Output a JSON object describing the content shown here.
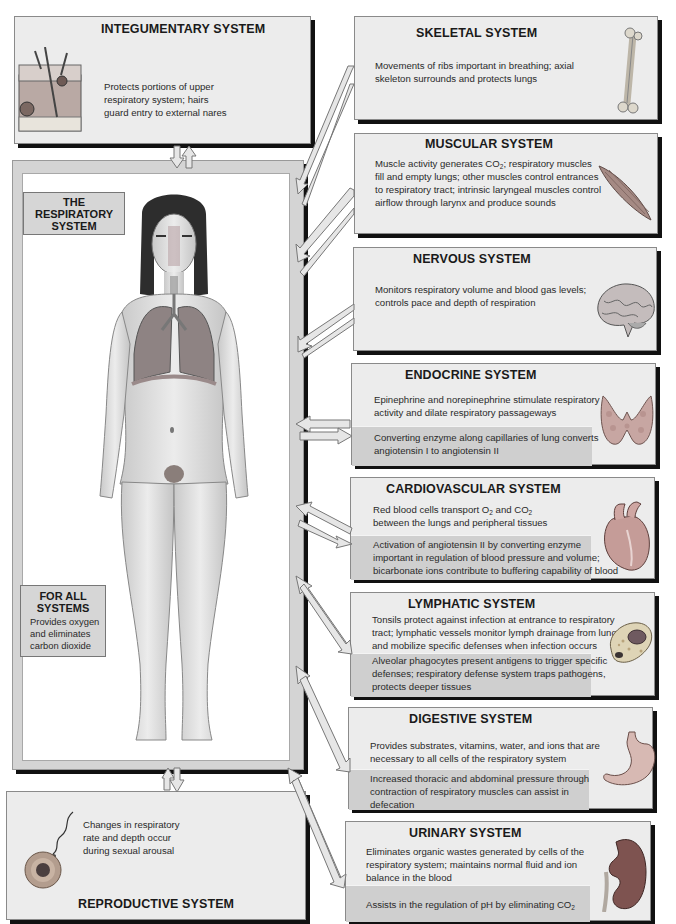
{
  "center": {
    "title_lines": [
      "THE",
      "RESPIRATORY",
      "SYSTEM"
    ],
    "for_all": {
      "title_lines": [
        "FOR ALL",
        "SYSTEMS"
      ],
      "text_lines": [
        "Provides oxygen",
        "and eliminates",
        "carbon dioxide"
      ]
    },
    "figure": "human-figure-with-respiratory-organs"
  },
  "systems": {
    "integumentary": {
      "title": "INTEGUMENTARY SYSTEM",
      "lines": [
        "Protects portions of upper",
        "respiratory system; hairs",
        "guard entry to external nares"
      ],
      "icon": "skin-section-icon"
    },
    "skeletal": {
      "title": "SKELETAL SYSTEM",
      "lines": [
        "Movements of ribs important in breathing; axial",
        "skeleton surrounds and protects lungs"
      ],
      "icon": "bone-icon"
    },
    "muscular": {
      "title": "MUSCULAR SYSTEM",
      "lines_html": [
        "Muscle activity generates CO<sub>2</sub>; respiratory muscles",
        "fill and empty lungs; other muscles control entrances",
        "to respiratory tract; intrinsic laryngeal muscles control",
        "airflow through larynx and produce sounds"
      ],
      "line1_pre": "Muscle activity generates CO",
      "line1_sub": "2",
      "line1_post": "; respiratory muscles",
      "line2": "fill and empty lungs; other muscles control entrances",
      "line3": "to respiratory tract; intrinsic laryngeal muscles control",
      "line4": "airflow through larynx and produce sounds",
      "icon": "muscle-icon"
    },
    "nervous": {
      "title": "NERVOUS SYSTEM",
      "lines": [
        "Monitors respiratory volume and blood gas levels;",
        "controls pace and depth of respiration"
      ],
      "icon": "brain-icon"
    },
    "endocrine": {
      "title": "ENDOCRINE SYSTEM",
      "lines": [
        "Epinephrine and norepinephrine stimulate respiratory",
        "activity and dilate respiratory passageways"
      ],
      "shaded_lines": [
        "Converting enzyme along capillaries of lung converts",
        "angiotensin I to angiotensin II"
      ],
      "icon": "thyroid-icon"
    },
    "cardiovascular": {
      "title": "CARDIOVASCULAR SYSTEM",
      "line1_a": "Red blood cells transport O",
      "line1_sub1": "2",
      "line1_b": " and CO",
      "line1_sub2": "2",
      "line2": "between the lungs and peripheral tissues",
      "shaded_lines": [
        "Activation of angiotensin II by converting enzyme",
        "important in regulation of blood pressure and volume;",
        "bicarbonate ions contribute to buffering capability of blood"
      ],
      "icon": "heart-icon"
    },
    "lymphatic": {
      "title": "LYMPHATIC SYSTEM",
      "lines": [
        "Tonsils protect against infection at entrance to respiratory",
        "tract; lymphatic vessels monitor lymph drainage from lungs",
        "and mobilize specific defenses when infection occurs"
      ],
      "shaded_lines": [
        "Alveolar phagocytes present antigens to trigger specific",
        "defenses; respiratory defense system traps pathogens,",
        "protects deeper tissues"
      ],
      "icon": "phagocyte-cell-icon"
    },
    "digestive": {
      "title": "DIGESTIVE SYSTEM",
      "lines": [
        "Provides substrates, vitamins, water, and ions that are",
        "necessary to all cells of the respiratory system"
      ],
      "shaded_lines": [
        "Increased thoracic and abdominal pressure through",
        "contraction of respiratory muscles can assist in",
        "defecation"
      ],
      "icon": "stomach-icon"
    },
    "urinary": {
      "title": "URINARY SYSTEM",
      "lines": [
        "Eliminates organic wastes generated by cells of the",
        "respiratory system; maintains normal fluid and ion",
        "balance in the blood"
      ],
      "shaded_pre": "Assists in the regulation of pH by eliminating CO",
      "shaded_sub": "2",
      "icon": "kidney-icon"
    },
    "reproductive": {
      "title": "REPRODUCTIVE SYSTEM",
      "lines": [
        "Changes in respiratory",
        "rate and depth occur",
        "during sexual arousal"
      ],
      "icon": "sperm-egg-icon"
    }
  },
  "colors": {
    "box_bg": "#ececec",
    "shade_bg": "#cfcfcf",
    "frame": "#d4d4d4",
    "shadow": "#111111"
  }
}
